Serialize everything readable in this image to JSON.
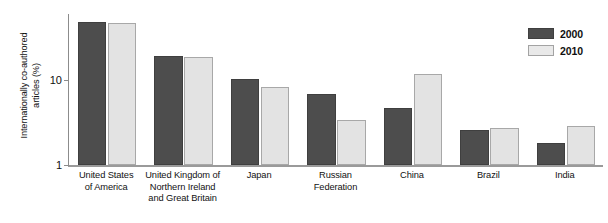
{
  "chart_data": {
    "type": "bar",
    "title": "",
    "subtitle": "",
    "xlabel": "",
    "ylabel": "Internationally co-authored articles (%)",
    "yscale": "log",
    "ylim": [
      1,
      60
    ],
    "ytick_labels": [
      "1",
      "10"
    ],
    "ytick_values": [
      1,
      10
    ],
    "grid": false,
    "legend_position": "top-right",
    "categories": [
      "United States of America",
      "United Kingdom of Northern Ireland and Great Britain",
      "Japan",
      "Russian Federation",
      "China",
      "Brazil",
      "India"
    ],
    "category_lines": [
      [
        "United States",
        "of America"
      ],
      [
        "United Kingdom of",
        "Northern Ireland",
        "and Great Britain"
      ],
      [
        "Japan"
      ],
      [
        "Russian Federation"
      ],
      [
        "China"
      ],
      [
        "Brazil"
      ],
      [
        "India"
      ]
    ],
    "series": [
      {
        "name": "2000",
        "color": "#4d4d4d",
        "values": [
          48.0,
          19.0,
          10.3,
          6.8,
          4.7,
          2.6,
          1.8
        ]
      },
      {
        "name": "2010",
        "color": "#e3e3e3",
        "values": [
          47.0,
          18.5,
          8.3,
          3.4,
          11.9,
          2.7,
          2.9
        ]
      }
    ]
  },
  "legend": {
    "items": [
      {
        "label": "2000",
        "color": "#4d4d4d"
      },
      {
        "label": "2010",
        "color": "#e9e9e9"
      }
    ]
  },
  "axis": {
    "y_title_line1": "Internationally co-authored",
    "y_title_line2": "articles (%)",
    "y_ticks": [
      "10",
      "1"
    ]
  }
}
